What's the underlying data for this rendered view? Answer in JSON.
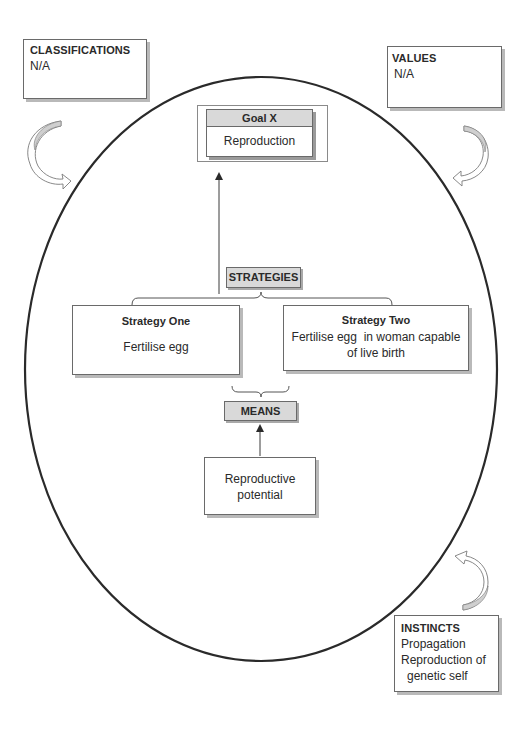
{
  "corner_boxes": {
    "classifications": {
      "title": "CLASSIFICATIONS",
      "lines": [
        "N/A"
      ]
    },
    "values": {
      "title": "VALUES",
      "lines": [
        "N/A"
      ]
    },
    "instincts": {
      "title": "INSTINCTS",
      "lines": [
        "Propagation",
        "Reproduction of",
        "genetic self"
      ]
    }
  },
  "goal": {
    "header": "Goal X",
    "body": "Reproduction"
  },
  "strategies": {
    "label": "STRATEGIES",
    "items": [
      {
        "title": "Strategy One",
        "lines": [
          "Fertilise egg"
        ]
      },
      {
        "title": "Strategy Two",
        "lines": [
          "Fertilise egg  in woman capable",
          "of live birth"
        ]
      }
    ]
  },
  "means": {
    "label": "MEANS",
    "box_lines": [
      "Reproductive",
      "potential"
    ]
  },
  "colors": {
    "outline": "#2a2a2a",
    "label_fill": "#d9d9d9",
    "shadow": "#b9b9b9",
    "arrow_fill": "#cfcfcf"
  }
}
